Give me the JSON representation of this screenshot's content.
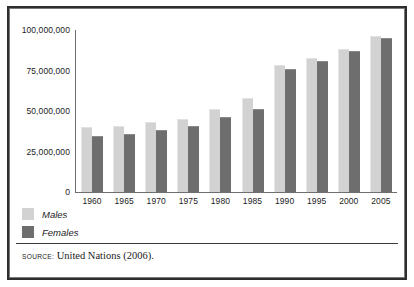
{
  "figure": {
    "background_color": "#ffffff",
    "border_color": "#2e2e2e",
    "inner_border_color": "#7a7a7a"
  },
  "chart_data": {
    "type": "bar",
    "title": "",
    "subtitle": "",
    "xlabel": "",
    "ylabel": "",
    "categories": [
      "1960",
      "1965",
      "1970",
      "1975",
      "1980",
      "1985",
      "1990",
      "1995",
      "2000",
      "2005"
    ],
    "series": [
      {
        "name": "Males",
        "color": "#d2d2d2",
        "values": [
          40000000,
          41000000,
          43000000,
          45000000,
          51500000,
          58000000,
          78500000,
          82500000,
          88000000,
          96500000
        ]
      },
      {
        "name": "Females",
        "color": "#6e6e6e",
        "values": [
          34500000,
          36000000,
          38000000,
          41000000,
          46500000,
          51500000,
          76000000,
          81000000,
          87000000,
          95000000
        ]
      }
    ],
    "ylim": [
      0,
      100000000
    ],
    "ytick_values": [
      100000000,
      75000000,
      50000000,
      25000000,
      0
    ],
    "ytick_labels": [
      "100,000,000",
      "75,000,000",
      "50,000,000",
      "25,000,000",
      "0"
    ],
    "grid": false,
    "legend_position": "below-left",
    "annotations": []
  },
  "legend": {
    "items": [
      {
        "label": "Males",
        "color": "#d2d2d2"
      },
      {
        "label": "Females",
        "color": "#6e6e6e"
      }
    ]
  },
  "source": {
    "kicker": "SOURCE:",
    "text": "United Nations (2006)."
  }
}
